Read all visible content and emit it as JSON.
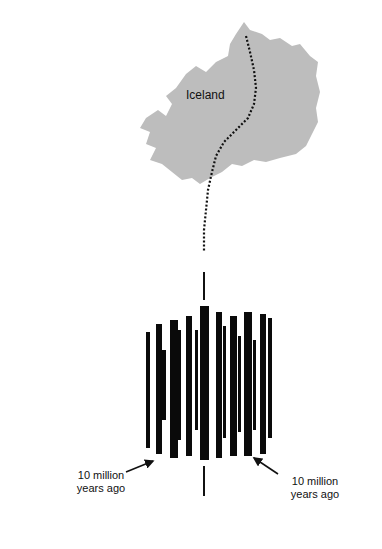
{
  "map": {
    "label": "Iceland",
    "land_color": "#bdbdbd",
    "ridge_color": "#111111"
  },
  "strips": {
    "ink_color": "#0a0a0a",
    "center_line_color": "#111111"
  },
  "annotations": {
    "left_label_line1": "10 million",
    "left_label_line2": "years ago",
    "right_label_line1": "10 million",
    "right_label_line2": "years ago"
  }
}
